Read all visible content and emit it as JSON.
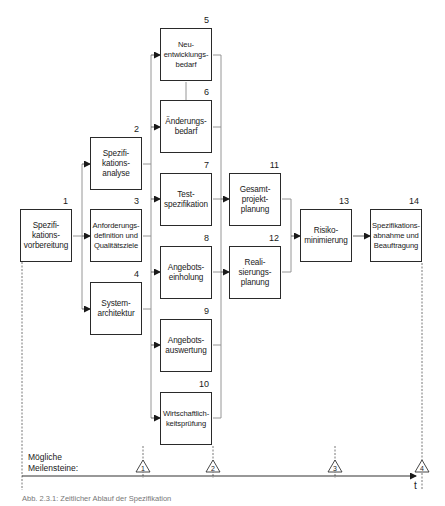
{
  "diagram": {
    "nodes": [
      {
        "id": 1,
        "number": "1",
        "label": "Spezifi-\nkations-\nvorbereitung"
      },
      {
        "id": 2,
        "number": "2",
        "label": "Spezifi-\nkations-\nanalyse"
      },
      {
        "id": 3,
        "number": "3",
        "label": "Anforderungs-\ndefinition und\nQualitätsziele"
      },
      {
        "id": 4,
        "number": "4",
        "label": "System-\narchitektur"
      },
      {
        "id": 5,
        "number": "5",
        "label": "Neu-\nentwicklungs-\nbedarf"
      },
      {
        "id": 6,
        "number": "6",
        "label": "Änderungs-\nbedarf"
      },
      {
        "id": 7,
        "number": "7",
        "label": "Test-\nspezifikation"
      },
      {
        "id": 8,
        "number": "8",
        "label": "Angebots-\neinholung"
      },
      {
        "id": 9,
        "number": "9",
        "label": "Angebots-\nauswertung"
      },
      {
        "id": 10,
        "number": "10",
        "label": "Wirtschaftlich-\nkeitsprüfung"
      },
      {
        "id": 11,
        "number": "11",
        "label": "Gesamt-\nprojekt-\nplanung"
      },
      {
        "id": 12,
        "number": "12",
        "label": "Reali-\nsierungs-\nplanung"
      },
      {
        "id": 13,
        "number": "13",
        "label": "Risiko-\nminimierung"
      },
      {
        "id": 14,
        "number": "14",
        "label": "Spezifikations-\nabnahme und\nBeauftragung"
      }
    ],
    "edges": [
      {
        "from": 1,
        "to": 2
      },
      {
        "from": 1,
        "to": 3
      },
      {
        "from": 1,
        "to": 4
      },
      {
        "from": 2,
        "to": 5
      },
      {
        "from": 2,
        "to": 6
      },
      {
        "from": 2,
        "to": 7
      },
      {
        "from": 3,
        "to": 8
      },
      {
        "from": 4,
        "to": 9
      },
      {
        "from": 4,
        "to": 10
      },
      {
        "from": 7,
        "to": 11
      },
      {
        "from": 8,
        "to": 12
      },
      {
        "from": 11,
        "to": 13
      },
      {
        "from": 12,
        "to": 13
      },
      {
        "from": 13,
        "to": 14
      }
    ],
    "timeline": {
      "milestones_label": "Mögliche\nMeilensteine:",
      "axis_label": "t",
      "milestones": [
        "1",
        "2",
        "3",
        "4"
      ]
    },
    "caption": "Abb. 2.3.1: Zeitlicher Ablauf der Spezifikation"
  }
}
